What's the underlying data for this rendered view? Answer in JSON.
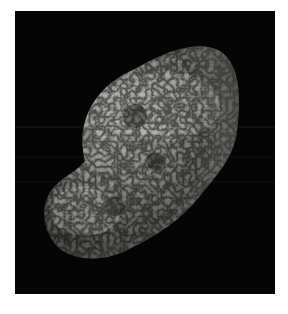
{
  "image": {
    "subject": "Hyperion (moon of Saturn)",
    "alt": "Grayscale photograph of Hyperion, a porous, sponge-like irregular moon against black space",
    "background_color": "#050505",
    "border_color": "#ffffff"
  }
}
